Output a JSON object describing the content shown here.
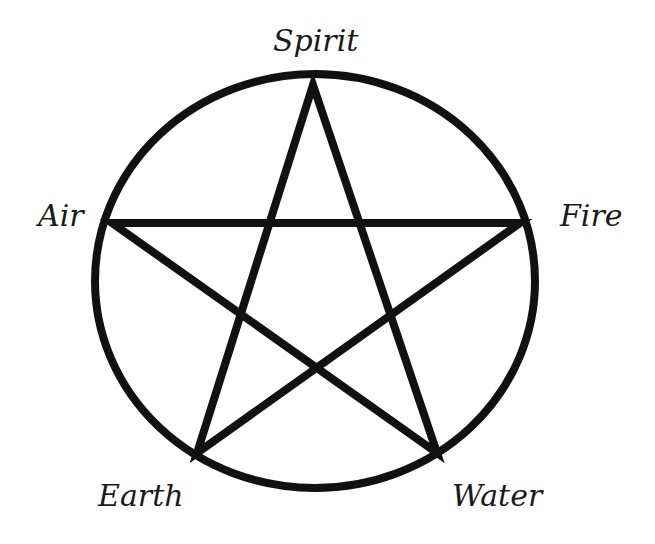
{
  "diagram": {
    "stroke_color": "#111111",
    "background": "#ffffff",
    "circle": {
      "cx": 315,
      "cy": 281,
      "rx": 220,
      "ry": 207,
      "stroke_width": 8
    },
    "star_points": "313,85 437,453 112,223 520,223 197,453",
    "labels": {
      "top": "Spirit",
      "left": "Air",
      "right": "Fire",
      "bottom_left": "Earth",
      "bottom_right": "Water"
    }
  }
}
